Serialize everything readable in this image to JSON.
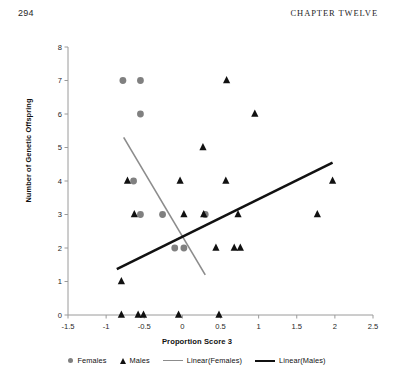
{
  "page": {
    "number": "294",
    "chapter": "CHAPTER TWELVE"
  },
  "chart_data": {
    "type": "scatter",
    "title": "",
    "xlabel": "Proportion Score 3",
    "ylabel": "Number of Genetic Offspring",
    "xlim": [
      -1.5,
      2.5
    ],
    "ylim": [
      0,
      8
    ],
    "xticks": [
      "-1.5",
      "-1",
      "-0.5",
      "0",
      "0.5",
      "1",
      "1.5",
      "2",
      "2.5"
    ],
    "xtick_values": [
      -1.5,
      -1,
      -0.5,
      0,
      0.5,
      1,
      1.5,
      2,
      2.5
    ],
    "yticks": [
      "0",
      "1",
      "2",
      "3",
      "4",
      "5",
      "6",
      "7",
      "8"
    ],
    "ytick_values": [
      0,
      1,
      2,
      3,
      4,
      5,
      6,
      7,
      8
    ],
    "grid": false,
    "legend_position": "bottom",
    "series": [
      {
        "name": "Females",
        "marker": "circle",
        "color": "#808080",
        "points": [
          [
            -0.78,
            7
          ],
          [
            -0.55,
            7
          ],
          [
            -0.55,
            6
          ],
          [
            -0.64,
            4
          ],
          [
            -0.55,
            3
          ],
          [
            -0.26,
            3
          ],
          [
            0.3,
            3
          ],
          [
            -0.1,
            2
          ],
          [
            0.02,
            2
          ]
        ]
      },
      {
        "name": "Males",
        "marker": "triangle",
        "color": "#111111",
        "points": [
          [
            0.58,
            7
          ],
          [
            0.95,
            6
          ],
          [
            0.27,
            5
          ],
          [
            -0.72,
            4
          ],
          [
            -0.03,
            4
          ],
          [
            0.57,
            4
          ],
          [
            1.97,
            4
          ],
          [
            -0.63,
            3
          ],
          [
            0.02,
            3
          ],
          [
            0.28,
            3
          ],
          [
            0.73,
            3
          ],
          [
            1.77,
            3
          ],
          [
            0.44,
            2
          ],
          [
            0.68,
            2
          ],
          [
            0.76,
            2
          ],
          [
            -0.8,
            1
          ],
          [
            -0.8,
            0
          ],
          [
            -0.58,
            0
          ],
          [
            -0.51,
            0
          ],
          [
            -0.05,
            0
          ],
          [
            0.48,
            0
          ]
        ]
      }
    ],
    "trendlines": [
      {
        "name": "Linear(Females)",
        "color": "#8c8c8c",
        "width": 1.6,
        "x_start": -0.77,
        "y_start": 5.3,
        "x_end": 0.3,
        "y_end": 1.2
      },
      {
        "name": "Linear(Males)",
        "color": "#111111",
        "width": 2.6,
        "x_start": -0.86,
        "y_start": 1.37,
        "x_end": 1.97,
        "y_end": 4.55
      }
    ],
    "legend": [
      {
        "label": "Females",
        "swatch": "circle"
      },
      {
        "label": "Males",
        "swatch": "triangle"
      },
      {
        "label": "Linear(Females)",
        "swatch": "line-gray"
      },
      {
        "label": "Linear(Males)",
        "swatch": "line-black"
      }
    ]
  }
}
